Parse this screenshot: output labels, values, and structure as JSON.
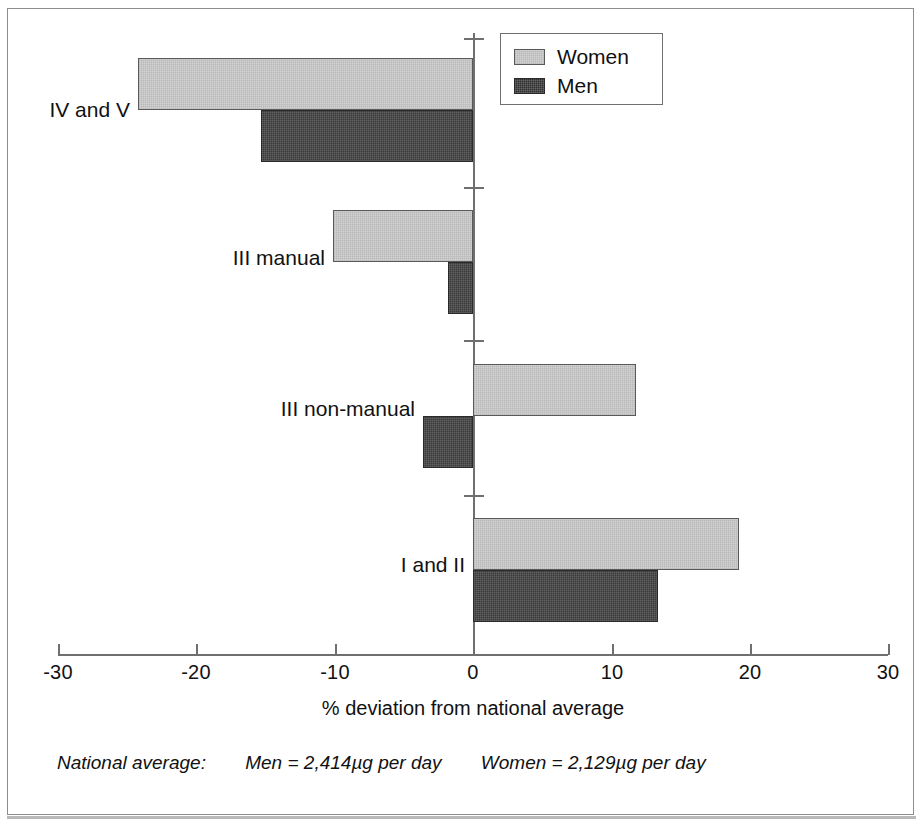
{
  "chart_data": {
    "type": "bar",
    "orientation": "horizontal",
    "title": "",
    "xlabel": "% deviation from national average",
    "ylabel": "",
    "categories": [
      "IV and V",
      "III manual",
      "III non-manual",
      "I and II"
    ],
    "series": [
      {
        "name": "Women",
        "color": "#d2d2d2",
        "values": [
          -24.2,
          -10.1,
          11.8,
          19.2
        ]
      },
      {
        "name": "Men",
        "color": "#3a3a3a",
        "values": [
          -15.3,
          -1.8,
          -3.6,
          13.4
        ]
      }
    ],
    "xlim": [
      -30,
      30
    ],
    "xticks": [
      -30,
      -20,
      -10,
      0,
      10,
      20,
      30
    ],
    "xtick_labels": [
      "-30",
      "-20",
      "-10",
      "0",
      "10",
      "20",
      "30"
    ],
    "grid": false,
    "legend_position": "top-right",
    "zero_reference_line": true
  },
  "legend": {
    "items": [
      {
        "label": "Women",
        "swatch": "women-swatch"
      },
      {
        "label": "Men",
        "swatch": "men-swatch"
      }
    ]
  },
  "axis": {
    "x_title": "% deviation from national average"
  },
  "footnote": {
    "label": "National average:",
    "men": "Men = 2,414µg per day",
    "women": "Women = 2,129µg per day"
  }
}
